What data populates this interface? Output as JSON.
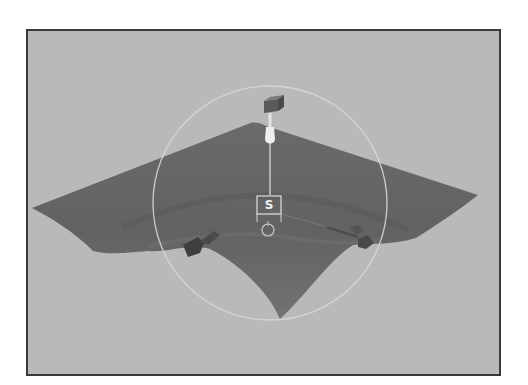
{
  "viewport": {
    "type": "3d-perspective-view",
    "background_color": "#b9b9b9",
    "border_color": "#3a3a3a"
  },
  "scene": {
    "surface": {
      "name": "deformed-plane",
      "fill_color": "#6e6e6e",
      "shade_color": "#5c5c5c"
    },
    "manipulator": {
      "falloff_circle_color": "#d8d8d8",
      "handle_color": "#5a5a5a",
      "stem_color": "#e4e4e4",
      "label": "S"
    },
    "handles": [
      {
        "name": "left-handle",
        "color": "#3e3e3e"
      },
      {
        "name": "right-handle",
        "color": "#555555"
      }
    ]
  }
}
